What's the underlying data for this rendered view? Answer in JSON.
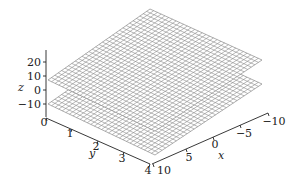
{
  "chart_data": {
    "type": "surface3d",
    "title": "",
    "xlabel": "x",
    "ylabel": "y",
    "zlabel": "z",
    "x_range": [
      -10,
      10
    ],
    "y_range": [
      0,
      4
    ],
    "z_range": [
      -10,
      20
    ],
    "x_ticks": [
      "10",
      "5",
      "0",
      "-5",
      "-10"
    ],
    "y_ticks": [
      "0",
      "1",
      "2",
      "3",
      "4"
    ],
    "z_ticks": [
      "20",
      "10",
      "0",
      "-10"
    ],
    "grid": false,
    "legend": null,
    "series": [
      {
        "name": "upper plane",
        "description": "flat wireframe plane (upper)",
        "z_level_approx": 10
      },
      {
        "name": "lower plane",
        "description": "flat wireframe plane (lower)",
        "z_level_approx": -10
      }
    ],
    "mesh_color": "#8a8a8a",
    "mesh_divisions": 30
  },
  "axes": {
    "z": {
      "label": "z",
      "ticks": [
        {
          "label": "20",
          "y": 62
        },
        {
          "label": "10",
          "y": 76
        },
        {
          "label": "0",
          "y": 90
        },
        {
          "label": "−10",
          "y": 104
        }
      ]
    },
    "y": {
      "label": "y",
      "ticks": [
        {
          "label": "0"
        },
        {
          "label": "1"
        },
        {
          "label": "2"
        },
        {
          "label": "3"
        },
        {
          "label": "4"
        }
      ]
    },
    "x": {
      "label": "x",
      "ticks": [
        {
          "label": "10"
        },
        {
          "label": "5"
        },
        {
          "label": "0"
        },
        {
          "label": "−5"
        },
        {
          "label": "−10"
        }
      ]
    }
  }
}
